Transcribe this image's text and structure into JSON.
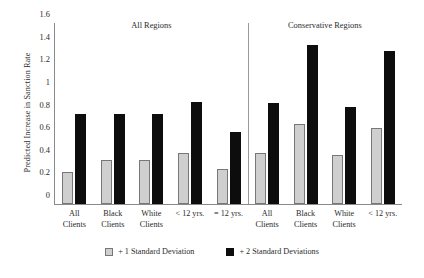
{
  "chart_data": {
    "type": "bar",
    "title": "",
    "xlabel": "",
    "ylabel": "Predicted Increase in Sanction Rate",
    "ylim": [
      0,
      1.6
    ],
    "ytick_labels": [
      "0",
      "0.2",
      "0.4",
      "0.6",
      "0.8",
      "1",
      "1.2",
      "1.4",
      "1.6"
    ],
    "ytick_values": [
      0,
      0.2,
      0.4,
      0.6,
      0.8,
      1.0,
      1.2,
      1.4,
      1.6
    ],
    "grid": false,
    "legend_position": "bottom",
    "series_names": [
      "+ 1 Standard Deviation",
      "+ 2 Standard Deviations"
    ],
    "series_colors": [
      "#cfcfcf",
      "#0d0d0d"
    ],
    "panels": [
      {
        "title": "All Regions",
        "categories": [
          "All\nClients",
          "Black\nClients",
          "White\nClients",
          "< 12 yrs.",
          "= 12 yrs."
        ],
        "series": [
          {
            "name": "+ 1 Standard Deviation",
            "values": [
              0.28,
              0.39,
              0.39,
              0.45,
              0.31
            ]
          },
          {
            "name": "+ 2 Standard Deviations",
            "values": [
              0.8,
              0.8,
              0.8,
              0.9,
              0.64
            ]
          }
        ]
      },
      {
        "title": "Conservative Regions",
        "categories": [
          "All\nClients",
          "Black\nClients",
          "White\nClients",
          "< 12 yrs."
        ],
        "series": [
          {
            "name": "+ 1 Standard Deviation",
            "values": [
              0.45,
              0.71,
              0.43,
              0.67
            ]
          },
          {
            "name": "+ 2 Standard Deviations",
            "values": [
              0.89,
              1.41,
              0.86,
              1.35
            ]
          }
        ]
      }
    ]
  },
  "legend": {
    "items": [
      {
        "label": "+ 1 Standard Deviation",
        "swatch": "light-gray-swatch"
      },
      {
        "label": "+ 2 Standard Deviations",
        "swatch": "black-swatch"
      }
    ]
  }
}
